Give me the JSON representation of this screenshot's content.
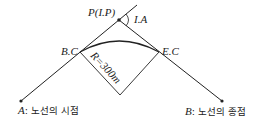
{
  "diagram": {
    "type": "route-curve",
    "labels": {
      "ip": "P(I.P)",
      "ia": "I.A",
      "bc": "B.C",
      "ec": "E.C",
      "radius": "R=300m",
      "start_letter": "A",
      "start_text": ": 노선의 시점",
      "end_letter": "B",
      "end_text": ": 노선의 종점"
    },
    "points": {
      "A": [
        21,
        101
      ],
      "IP": [
        119,
        20
      ],
      "B": [
        222,
        101
      ],
      "BC": [
        80,
        52
      ],
      "EC": [
        159,
        52
      ],
      "center": [
        120,
        95
      ],
      "tangent_ext": [
        137,
        5
      ]
    },
    "radius_m": 300,
    "colors": {
      "line": "#222222",
      "background": "#ffffff"
    }
  }
}
